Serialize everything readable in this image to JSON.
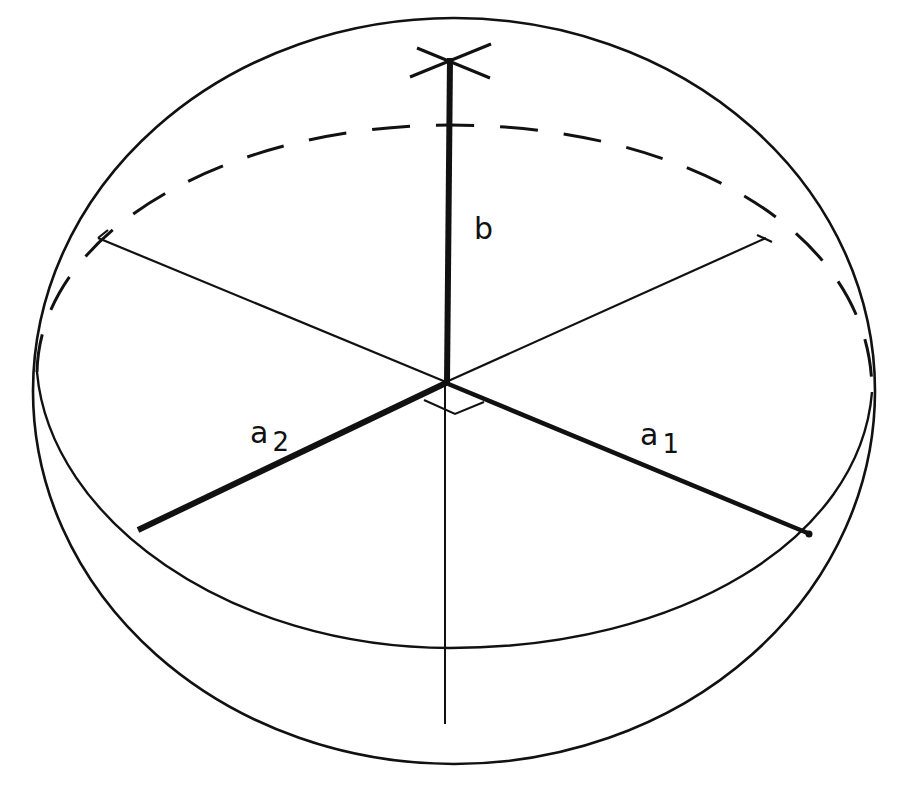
{
  "diagram": {
    "type": "geometric-figure",
    "colors": {
      "ink": "#111111",
      "background": "#ffffff"
    },
    "labels": {
      "b": {
        "main": "b",
        "sub": ""
      },
      "a2": {
        "main": "a",
        "sub": "2"
      },
      "a1": {
        "main": "a",
        "sub": "1"
      }
    },
    "elements": [
      "outer-ellipsoid-outline",
      "equatorial-ellipse-front-solid",
      "equatorial-ellipse-back-dashed",
      "semi-axis-b-vertical-bold",
      "semi-axis-a1-bold",
      "semi-axis-a2-bold",
      "back-half-axis-left-thin",
      "back-half-axis-right-thin",
      "vertical-axis-below-thin",
      "right-angle-marker",
      "tick-cross-top"
    ]
  }
}
